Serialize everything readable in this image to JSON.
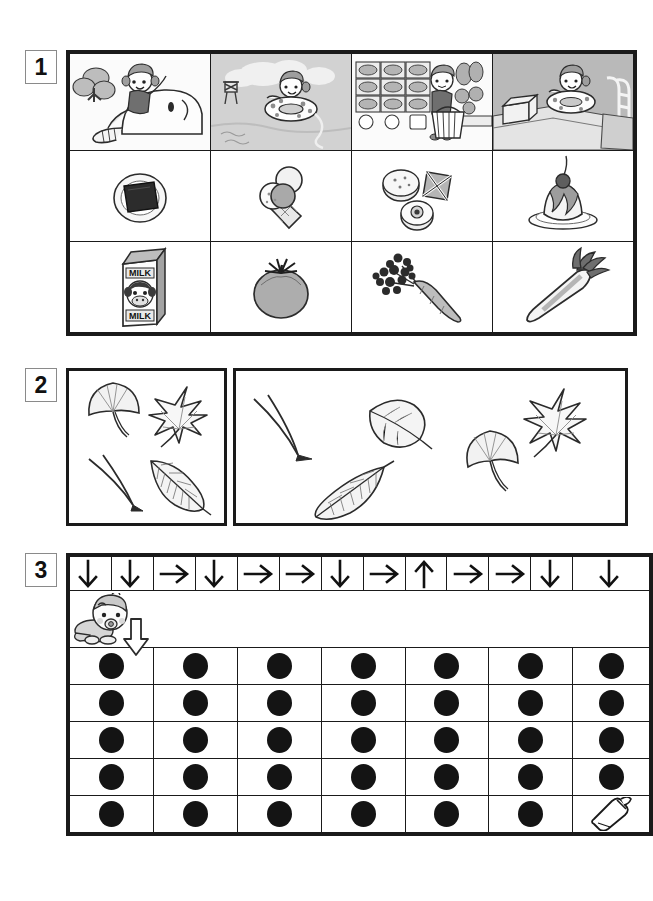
{
  "worksheet": {
    "title": "Picture classification and maze worksheet",
    "background_color": "#ffffff",
    "ink_color": "#1a1a1a"
  },
  "sections": [
    {
      "number": "1",
      "name": "picture-grid",
      "rows": [
        {
          "name": "scene-row",
          "shaded": true,
          "cells": [
            {
              "label": "girl-playing-on-elephant-slide-in-park",
              "icon": "park-slide-scene",
              "background": "#fbfbfb"
            },
            {
              "label": "girl-swimming-in-sea-with-float-ring",
              "icon": "sea-swimming-scene",
              "background": "#d2d2d2"
            },
            {
              "label": "girl-shopping-with-basket-at-supermarket",
              "icon": "supermarket-scene",
              "background": "#fbfbfb"
            },
            {
              "label": "girl-in-swimming-pool-with-float-ring",
              "icon": "pool-scene",
              "background": "#b9b9b9"
            }
          ]
        },
        {
          "name": "food-row-one",
          "shaded": false,
          "cells": [
            {
              "label": "nori-seaweed-rice-cake-on-plate",
              "icon": "nori-rice-icon",
              "background": "#ffffff"
            },
            {
              "label": "two-scoop-ice-cream-cone",
              "icon": "ice-cream-cone-icon",
              "background": "#ffffff"
            },
            {
              "label": "assorted-sushi-rolls",
              "icon": "sushi-rolls-icon",
              "background": "#ffffff"
            },
            {
              "label": "custard-pudding-with-cherry-on-plate",
              "icon": "pudding-icon",
              "background": "#ffffff"
            }
          ]
        },
        {
          "name": "food-row-two",
          "shaded": false,
          "cells": [
            {
              "label": "milk-carton-with-cow-face",
              "icon": "milk-carton-icon",
              "background": "#ffffff",
              "text": "MILK"
            },
            {
              "label": "tomato",
              "icon": "tomato-icon",
              "background": "#ffffff"
            },
            {
              "label": "carrot-with-leaves",
              "icon": "carrot-icon",
              "background": "#ffffff"
            },
            {
              "label": "daikon-radish",
              "icon": "daikon-radish-icon",
              "background": "#ffffff"
            }
          ]
        }
      ]
    },
    {
      "number": "2",
      "name": "leaf-matching",
      "boxes": [
        {
          "name": "leaf-sample-box",
          "items": [
            {
              "label": "ginkgo-leaf",
              "icon": "ginkgo-leaf-icon"
            },
            {
              "label": "maple-leaf",
              "icon": "maple-leaf-icon"
            },
            {
              "label": "pine-needles",
              "icon": "pine-needle-icon"
            },
            {
              "label": "serrated-zelkova-leaf",
              "icon": "serrated-leaf-icon"
            }
          ]
        },
        {
          "name": "leaf-answer-box",
          "items": [
            {
              "label": "pine-needles",
              "icon": "pine-needle-icon"
            },
            {
              "label": "smooth-oval-leaf",
              "icon": "oval-leaf-icon"
            },
            {
              "label": "serrated-zelkova-leaf",
              "icon": "serrated-leaf-icon"
            },
            {
              "label": "ginkgo-leaf",
              "icon": "ginkgo-leaf-icon"
            },
            {
              "label": "maple-leaf",
              "icon": "maple-leaf-icon"
            }
          ]
        }
      ]
    },
    {
      "number": "3",
      "name": "arrow-maze",
      "arrow_sequence": [
        "down",
        "down",
        "right",
        "down",
        "right",
        "right",
        "down",
        "right",
        "up",
        "right",
        "right",
        "down",
        "down"
      ],
      "arrow_glyphs": {
        "down": "↓",
        "right": "→",
        "up": "↑"
      },
      "start": {
        "label": "crawling-baby-start",
        "icon": "baby-icon",
        "entry_marker": "white-down-arrow"
      },
      "goal": {
        "label": "baby-bottle-goal",
        "icon": "baby-bottle-icon"
      },
      "grid": {
        "columns": 7,
        "rows": 5,
        "cell_content": "dot",
        "cells": [
          [
            "dot",
            "dot",
            "dot",
            "dot",
            "dot",
            "dot",
            "dot"
          ],
          [
            "dot",
            "dot",
            "dot",
            "dot",
            "dot",
            "dot",
            "dot"
          ],
          [
            "dot",
            "dot",
            "dot",
            "dot",
            "dot",
            "dot",
            "dot"
          ],
          [
            "dot",
            "dot",
            "dot",
            "dot",
            "dot",
            "dot",
            "dot"
          ],
          [
            "dot",
            "dot",
            "dot",
            "dot",
            "dot",
            "dot",
            "bottle"
          ]
        ]
      }
    }
  ]
}
